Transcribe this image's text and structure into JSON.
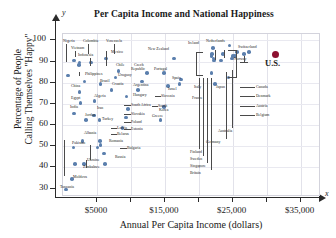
{
  "chart_data": {
    "type": "scatter",
    "title": "Per Capita Income and National Happiness",
    "xlabel": "Annual Per Capita Income (dollars)",
    "ylabel_line1": "Percentage of People",
    "ylabel_line2": "Calling Themselves \"Happy\"",
    "x_axis_letter": "x",
    "y_axis_letter": "y",
    "xlim": [
      0,
      38000
    ],
    "ylim": [
      26,
      103
    ],
    "grid": "vertical gridlines every $5000; faint horizontal gridlines every 10 percent",
    "legend": "none",
    "y_ticks": [
      30,
      40,
      50,
      60,
      70,
      80,
      90,
      100
    ],
    "y_tick_labels": [
      "30",
      "40",
      "50",
      "60",
      "70",
      "80",
      "90",
      "100"
    ],
    "x_ticks": [
      5000,
      10000,
      15000,
      20000,
      25000,
      30000,
      35000
    ],
    "x_tick_labels": [
      "$5000",
      "$15,000",
      "$25,000",
      "$35,000"
    ],
    "x_labeled_ticks": [
      5000,
      15000,
      25000,
      35000
    ],
    "point_color": "#5b7fad",
    "highlight_color": "#8d1030",
    "points": [
      {
        "name": "Nigeria",
        "x": 900,
        "y": 83
      },
      {
        "name": "Colombia",
        "x": 2600,
        "y": 89
      },
      {
        "name": "Venezuela",
        "x": 4300,
        "y": 89
      },
      {
        "name": "Vietnam",
        "x": 1800,
        "y": 90
      },
      {
        "name": "Indonesia",
        "x": 2500,
        "y": 88
      },
      {
        "name": "Mexico",
        "x": 6500,
        "y": 91
      },
      {
        "name": "Chile",
        "x": 8300,
        "y": 85
      },
      {
        "name": "Philippines",
        "x": 3300,
        "y": 80
      },
      {
        "name": "Brazil",
        "x": 5700,
        "y": 79
      },
      {
        "name": "Uruguay",
        "x": 7900,
        "y": 82
      },
      {
        "name": "Croatia",
        "x": 7300,
        "y": 76
      },
      {
        "name": "China",
        "x": 2600,
        "y": 75
      },
      {
        "name": "Egypt",
        "x": 2700,
        "y": 70
      },
      {
        "name": "Algeria",
        "x": 4800,
        "y": 71
      },
      {
        "name": "India",
        "x": 1800,
        "y": 65
      },
      {
        "name": "Iran",
        "x": 4700,
        "y": 64
      },
      {
        "name": "Jordan",
        "x": 3500,
        "y": 62
      },
      {
        "name": "Turkey",
        "x": 5500,
        "y": 62
      },
      {
        "name": "Albania",
        "x": 3000,
        "y": 52
      },
      {
        "name": "Latvia",
        "x": 5600,
        "y": 52
      },
      {
        "name": "Belarus",
        "x": 5700,
        "y": 50
      },
      {
        "name": "Pakistan",
        "x": 1700,
        "y": 49
      },
      {
        "name": "Romania",
        "x": 5200,
        "y": 49
      },
      {
        "name": "Bulgaria",
        "x": 6200,
        "y": 46
      },
      {
        "name": "Ukraine",
        "x": 3200,
        "y": 41
      },
      {
        "name": "Zimbabwe",
        "x": 1900,
        "y": 41
      },
      {
        "name": "Russia",
        "x": 6300,
        "y": 41
      },
      {
        "name": "Moldova",
        "x": 1500,
        "y": 34
      },
      {
        "name": "Tanzania",
        "x": 600,
        "y": 29
      },
      {
        "name": "New Zealand",
        "x": 16500,
        "y": 91
      },
      {
        "name": "Czech Republic",
        "x": 12500,
        "y": 84
      },
      {
        "name": "Portugal",
        "x": 15000,
        "y": 84
      },
      {
        "name": "Argentina",
        "x": 11800,
        "y": 80
      },
      {
        "name": "Spain",
        "x": 17500,
        "y": 81
      },
      {
        "name": "Israel",
        "x": 17300,
        "y": 79
      },
      {
        "name": "Hungary",
        "x": 11200,
        "y": 76
      },
      {
        "name": "Slovenia",
        "x": 15600,
        "y": 78
      },
      {
        "name": "South Africa",
        "x": 9500,
        "y": 73
      },
      {
        "name": "Slovakia",
        "x": 9700,
        "y": 67
      },
      {
        "name": "South Korea",
        "x": 15000,
        "y": 68
      },
      {
        "name": "Poland",
        "x": 9400,
        "y": 63
      },
      {
        "name": "Greece",
        "x": 14500,
        "y": 62
      },
      {
        "name": "Estonia",
        "x": 8900,
        "y": 58
      },
      {
        "name": "Ireland",
        "x": 22200,
        "y": 96
      },
      {
        "name": "Netherlands",
        "x": 24700,
        "y": 97
      },
      {
        "name": "Switzerland",
        "x": 27500,
        "y": 94
      },
      {
        "name": "Norway",
        "x": 26800,
        "y": 93
      },
      {
        "name": "Italy",
        "x": 22000,
        "y": 84
      },
      {
        "name": "Japan",
        "x": 24500,
        "y": 82
      },
      {
        "name": "France",
        "x": 22500,
        "y": 79
      },
      {
        "name": "Australia",
        "x": 23700,
        "y": 93
      },
      {
        "name": "Germany",
        "x": 23400,
        "y": 90
      },
      {
        "name": "Canada",
        "x": 25500,
        "y": 92
      },
      {
        "name": "Denmark",
        "x": 25800,
        "y": 94
      },
      {
        "name": "Austria",
        "x": 25200,
        "y": 92
      },
      {
        "name": "Belgium",
        "x": 25000,
        "y": 91
      },
      {
        "name": "Finland",
        "x": 22000,
        "y": 92
      },
      {
        "name": "Sweden",
        "x": 22100,
        "y": 93
      },
      {
        "name": "Singapore",
        "x": 22300,
        "y": 91
      },
      {
        "name": "Britain",
        "x": 22400,
        "y": 90
      },
      {
        "name": "U.S.",
        "x": 31500,
        "y": 93,
        "highlight": true
      }
    ]
  },
  "labels": {
    "nigeria": "Nigeria",
    "colombia": "Colombia",
    "venezuela": "Venezuela",
    "vietnam": "Vietnam",
    "indonesia": "Indonesia",
    "mexico": "Mexico",
    "chile": "Chile",
    "philippines": "Philippines",
    "brazil": "Brazil",
    "uruguay": "Uruguay",
    "croatia": "Croatia",
    "china": "China",
    "egypt": "Egypt",
    "algeria": "Algeria",
    "india": "India",
    "iran": "Iran",
    "jordan": "Jordan",
    "turkey": "Turkey",
    "albania": "Albania",
    "latvia": "Latvia",
    "belarus": "Belarus",
    "pakistan": "Pakistan",
    "romania": "Romania",
    "bulgaria": "Bulgaria",
    "ukraine": "Ukraine",
    "zimbabwe": "Zimbabwe",
    "russia": "Russia",
    "moldova": "Moldova",
    "tanzania": "Tanzania",
    "new_zealand": "New Zealand",
    "czech_republic": "Czech",
    "czech_republic2": "Republic",
    "portugal": "Portugal",
    "argentina": "Argentina",
    "spain": "Spain",
    "israel": "Israel",
    "hungary": "Hungary",
    "slovenia": "Slovenia",
    "south_africa": "South Africa",
    "slovakia": "Slovakia",
    "south_korea": "South",
    "south_korea2": "Korea",
    "poland": "Poland",
    "greece": "Greece",
    "estonia": "Estonia",
    "ireland": "Ireland",
    "netherlands": "Netherlands",
    "switzerland": "Switzerland",
    "norway": "Norway",
    "italy": "Italy",
    "japan": "Japan",
    "france": "France",
    "australia": "Australia",
    "germany": "Germany",
    "canada": "Canada",
    "denmark": "Denmark",
    "austria": "Austria",
    "belgium": "Belgium",
    "finland": "Finland",
    "sweden": "Sweden",
    "singapore": "Singapore",
    "britain": "Britain",
    "us": "U.S."
  }
}
